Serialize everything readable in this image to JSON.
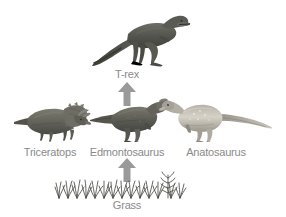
{
  "diagram": {
    "background_color": "#ffffff",
    "label_color": "#8a8a8a",
    "arrow_color": "#9a9a9a"
  },
  "levels": {
    "producer": {
      "label": "Grass",
      "organism": "grass",
      "icon": "grass-icon"
    },
    "primary_consumers": [
      {
        "label": "Triceratops",
        "organism": "triceratops",
        "icon": "triceratops-icon",
        "facing": "right",
        "body_color": "#6f6f68"
      },
      {
        "label": "Edmontosaurus",
        "organism": "edmontosaurus",
        "icon": "edmontosaurus-icon",
        "facing": "right",
        "body_color": "#6b6b63"
      },
      {
        "label": "Anatosaurus",
        "organism": "anatosaurus",
        "icon": "anatosaurus-icon",
        "facing": "left",
        "body_color": "#a8a49a"
      }
    ],
    "apex_predator": {
      "label": "T-rex",
      "organism": "t-rex",
      "icon": "trex-icon",
      "facing": "right",
      "body_color": "#595953"
    }
  },
  "arrows": [
    {
      "name": "grass-to-edmontosaurus",
      "from": "Grass",
      "to": "Edmontosaurus",
      "direction": "up"
    },
    {
      "name": "edmontosaurus-to-trex",
      "from": "Edmontosaurus",
      "to": "T-rex",
      "direction": "up"
    }
  ]
}
